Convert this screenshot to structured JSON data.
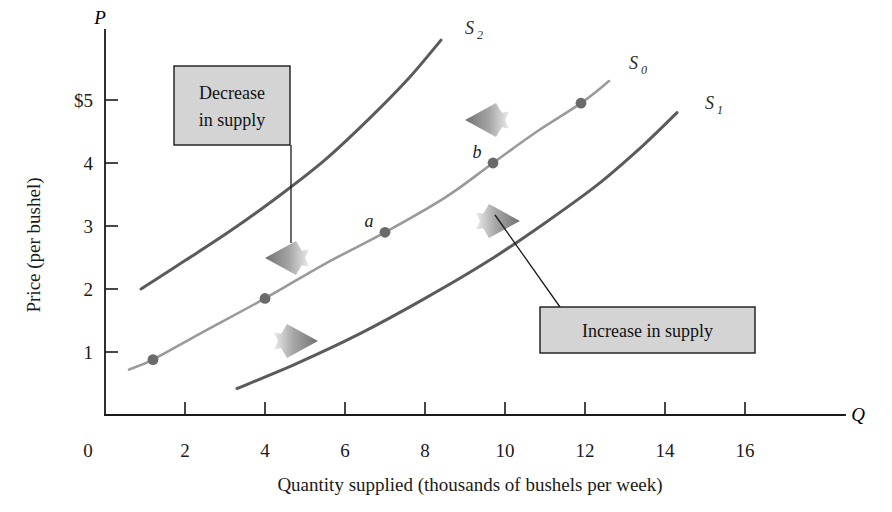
{
  "axes": {
    "y": {
      "symbol": "P",
      "title": "Price (per bushel)",
      "ticks": [
        "1",
        "2",
        "3",
        "4",
        "$5"
      ],
      "tick_values": [
        1,
        2,
        3,
        4,
        5
      ],
      "min": 0,
      "max": 5.8
    },
    "x": {
      "symbol": "Q",
      "title": "Quantity supplied (thousands of bushels per week)",
      "origin_label": "0",
      "ticks": [
        "2",
        "4",
        "6",
        "8",
        "10",
        "12",
        "14",
        "16"
      ],
      "tick_values": [
        2,
        4,
        6,
        8,
        10,
        12,
        14,
        16
      ],
      "min": 0,
      "max": 19.5
    }
  },
  "curves": [
    {
      "id": "S2",
      "label": "S",
      "subscript": "2",
      "color": "#5b5b5b",
      "width": 3.0,
      "description": "decreased supply curve, shifted left",
      "points": [
        [
          0.9,
          2.0
        ],
        [
          2.0,
          2.45
        ],
        [
          3.2,
          2.95
        ],
        [
          4.4,
          3.5
        ],
        [
          5.5,
          4.05
        ],
        [
          6.6,
          4.7
        ],
        [
          7.6,
          5.35
        ],
        [
          8.4,
          5.95
        ]
      ],
      "label_x": 9.0,
      "label_y": 6.05
    },
    {
      "id": "S0",
      "label": "S",
      "subscript": "0",
      "color": "#9a9a9a",
      "width": 2.6,
      "description": "original supply curve",
      "points": [
        [
          0.6,
          0.72
        ],
        [
          1.2,
          0.88
        ],
        [
          2.4,
          1.3
        ],
        [
          4.0,
          1.85
        ],
        [
          5.5,
          2.4
        ],
        [
          7.0,
          2.9
        ],
        [
          8.5,
          3.45
        ],
        [
          9.7,
          4.0
        ],
        [
          10.8,
          4.5
        ],
        [
          11.9,
          4.95
        ],
        [
          12.6,
          5.3
        ]
      ],
      "label_x": 13.1,
      "label_y": 5.5
    },
    {
      "id": "S1",
      "label": "S",
      "subscript": "1",
      "color": "#5b5b5b",
      "width": 3.0,
      "description": "increased supply curve, shifted right",
      "points": [
        [
          3.3,
          0.42
        ],
        [
          4.8,
          0.82
        ],
        [
          6.4,
          1.3
        ],
        [
          8.0,
          1.85
        ],
        [
          9.6,
          2.45
        ],
        [
          11.0,
          3.05
        ],
        [
          12.3,
          3.65
        ],
        [
          13.4,
          4.25
        ],
        [
          14.3,
          4.8
        ]
      ],
      "label_x": 15.0,
      "label_y": 4.85
    }
  ],
  "data_points": [
    {
      "label": "",
      "q": 1.2,
      "p": 0.88,
      "on": "S0"
    },
    {
      "label": "",
      "q": 4.0,
      "p": 1.85,
      "on": "S0"
    },
    {
      "label": "a",
      "q": 7.0,
      "p": 2.9,
      "on": "S0"
    },
    {
      "label": "b",
      "q": 9.7,
      "p": 4.0,
      "on": "S0"
    },
    {
      "label": "",
      "q": 11.9,
      "p": 4.95,
      "on": "S0"
    }
  ],
  "callouts": [
    {
      "id": "decrease",
      "lines": [
        "Decrease",
        "in supply"
      ],
      "box": {
        "x": 174,
        "y": 66,
        "w": 116,
        "h": 79
      },
      "leader": {
        "x1": 291,
        "y1": 145,
        "x2": 291,
        "y2": 243
      },
      "arrow_direction": "left"
    },
    {
      "id": "increase",
      "lines": [
        "Increase in supply"
      ],
      "box": {
        "x": 540,
        "y": 307,
        "w": 215,
        "h": 46
      },
      "leader": {
        "x1": 560,
        "y1": 307,
        "x2": 495,
        "y2": 215
      },
      "arrow_direction": "right"
    }
  ],
  "shift_arrows": [
    {
      "id": "decrease-upper",
      "direction": "left",
      "cx": 487,
      "cy": 120,
      "color": "#8c8c8c"
    },
    {
      "id": "decrease-lower",
      "direction": "left",
      "cx": 287,
      "cy": 258,
      "color": "#8c8c8c"
    },
    {
      "id": "increase-upper",
      "direction": "right",
      "cx": 498,
      "cy": 221,
      "color": "#8c8c8c"
    },
    {
      "id": "increase-lower",
      "direction": "right",
      "cx": 296,
      "cy": 341,
      "color": "#8c8c8c"
    }
  ],
  "colors": {
    "s0": "#9a9a9a",
    "s1_s2": "#5b5b5b",
    "arrow": "#8c8c8c",
    "callout_fill": "#d4d4d4",
    "ink": "#1a1a1a",
    "point": "#6a6a6a"
  }
}
